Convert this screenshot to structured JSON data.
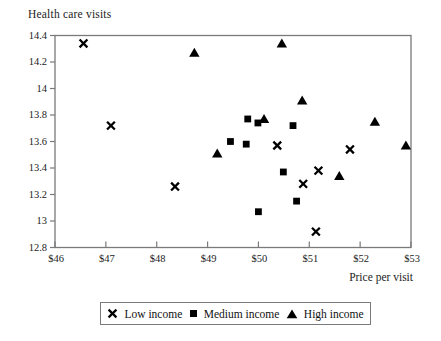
{
  "figure": {
    "title": "Health care visits",
    "xlabel": "Price per visit"
  },
  "colors": {
    "axis": "#7a7a7a",
    "marker": "#000000",
    "text": "#1c1c1c",
    "background": "#ffffff",
    "legend_border": "#7a7a7a"
  },
  "chart_data": {
    "type": "scatter",
    "title": "Health care visits",
    "xlabel": "Price per visit",
    "ylabel": "Health care visits",
    "xlim": [
      46,
      53
    ],
    "ylim": [
      12.8,
      14.4
    ],
    "grid": false,
    "legend_position": "bottom",
    "x_tick_values": [
      46,
      47,
      48,
      49,
      50,
      51,
      52,
      53
    ],
    "x_tick_labels": [
      "$46",
      "$47",
      "$48",
      "$49",
      "$50",
      "$51",
      "$52",
      "$53"
    ],
    "y_tick_values": [
      12.8,
      13,
      13.2,
      13.4,
      13.6,
      13.8,
      14,
      14.2,
      14.4
    ],
    "y_tick_labels": [
      "12.8",
      "13",
      "13.2",
      "13.4",
      "13.6",
      "13.8",
      "14",
      "14.2",
      "14.4"
    ],
    "series": [
      {
        "name": "Low income",
        "marker": "x",
        "points": [
          [
            46.56,
            14.34
          ],
          [
            47.1,
            13.72
          ],
          [
            48.36,
            13.26
          ],
          [
            50.37,
            13.57
          ],
          [
            50.88,
            13.28
          ],
          [
            51.13,
            12.92
          ],
          [
            51.18,
            13.38
          ],
          [
            51.8,
            13.54
          ]
        ]
      },
      {
        "name": "Medium income",
        "marker": "square",
        "points": [
          [
            49.45,
            13.6
          ],
          [
            49.76,
            13.58
          ],
          [
            49.79,
            13.77
          ],
          [
            49.99,
            13.74
          ],
          [
            50.0,
            13.07
          ],
          [
            50.49,
            13.37
          ],
          [
            50.68,
            13.72
          ],
          [
            50.75,
            13.15
          ]
        ]
      },
      {
        "name": "High income",
        "marker": "triangle",
        "points": [
          [
            48.74,
            14.27
          ],
          [
            49.19,
            13.51
          ],
          [
            50.11,
            13.77
          ],
          [
            50.46,
            14.34
          ],
          [
            50.86,
            13.91
          ],
          [
            51.59,
            13.34
          ],
          [
            52.29,
            13.75
          ],
          [
            52.9,
            13.57
          ]
        ]
      }
    ]
  }
}
